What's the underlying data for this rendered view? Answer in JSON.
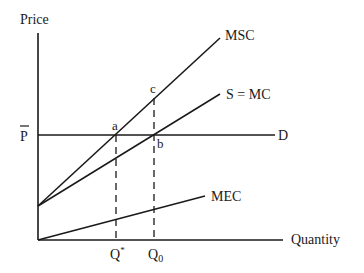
{
  "diagram": {
    "type": "economics-externality-supply-demand",
    "axes": {
      "y_label": "Price",
      "x_label": "Quantity"
    },
    "price_label": "P",
    "price_label_bar": true,
    "curves": [
      {
        "id": "msc",
        "label": "MSC"
      },
      {
        "id": "supply",
        "label": "S = MC"
      },
      {
        "id": "demand",
        "label": "D"
      },
      {
        "id": "mec",
        "label": "MEC"
      }
    ],
    "points": [
      {
        "id": "a",
        "label": "a"
      },
      {
        "id": "b",
        "label": "b"
      },
      {
        "id": "c",
        "label": "c"
      }
    ],
    "quantities": [
      {
        "id": "q_star",
        "label": "Q",
        "superscript": "*"
      },
      {
        "id": "q_0",
        "label": "Q",
        "subscript": "0"
      }
    ]
  }
}
